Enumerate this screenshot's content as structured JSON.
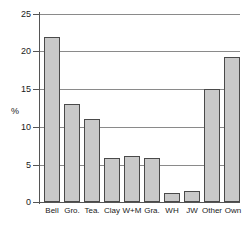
{
  "chart_data": {
    "type": "bar",
    "title": "",
    "xlabel": "",
    "ylabel": "%",
    "ylim": [
      0,
      25
    ],
    "yticks": [
      0,
      5,
      10,
      15,
      20,
      25
    ],
    "grid": true,
    "legend": "none",
    "categories": [
      "Bell",
      "Gro.",
      "Tea.",
      "Clay",
      "W+M",
      "Gra.",
      "WH",
      "JW",
      "Other",
      "Own"
    ],
    "values": [
      22.0,
      13.0,
      11.0,
      5.9,
      6.1,
      5.9,
      1.2,
      1.4,
      15.0,
      19.3
    ],
    "bar_color": "#c9c9c9",
    "bar_edge_color": "#4a4a4a",
    "grid_color": "#8a8a8a",
    "axis_color": "#555555"
  }
}
